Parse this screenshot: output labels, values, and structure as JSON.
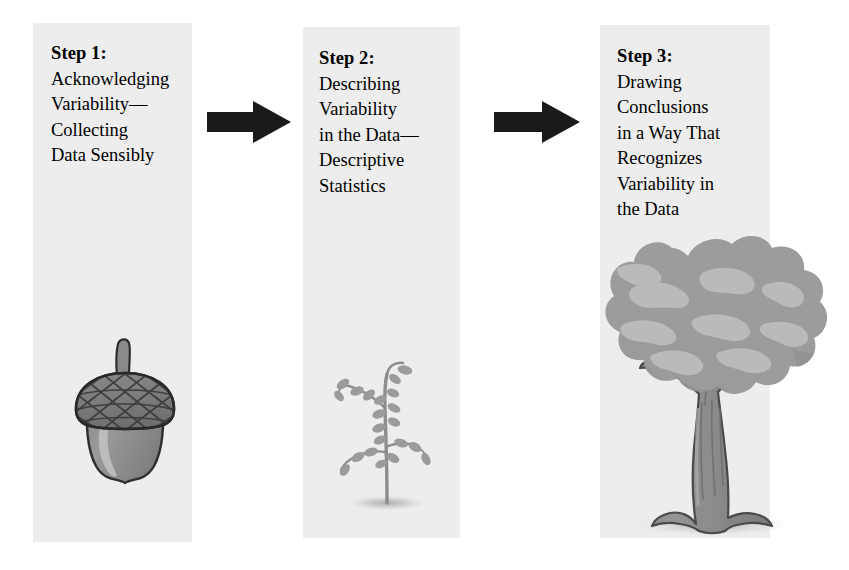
{
  "diagram": {
    "background_color": "#ffffff",
    "panel_color": "#ededed",
    "arrow_color": "#1a1a1a",
    "artwork_color": "#8f8f8f",
    "artwork_highlight_color": "#b9b9b9",
    "steps": [
      {
        "id": "step-1",
        "heading": "Step 1:",
        "body_lines": [
          "Acknowledging",
          "Variability—",
          "Collecting",
          "Data Sensibly"
        ],
        "illustration": "acorn-illustration",
        "illustration_label": "Acorn"
      },
      {
        "id": "step-2",
        "heading": "Step 2:",
        "body_lines": [
          "Describing",
          "Variability",
          "in the Data—",
          "Descriptive",
          "Statistics"
        ],
        "illustration": "sapling-illustration",
        "illustration_label": "Sapling"
      },
      {
        "id": "step-3",
        "heading": "Step 3:",
        "body_lines": [
          "Drawing",
          "Conclusions",
          "in a Way That",
          "Recognizes",
          "Variability in",
          "the Data"
        ],
        "illustration": "oak-tree-illustration",
        "illustration_label": "Oak tree"
      }
    ],
    "connectors": [
      {
        "id": "arrow-1",
        "icon": "right-arrow-icon",
        "from": "step-1",
        "to": "step-2"
      },
      {
        "id": "arrow-2",
        "icon": "right-arrow-icon",
        "from": "step-2",
        "to": "step-3"
      }
    ]
  }
}
